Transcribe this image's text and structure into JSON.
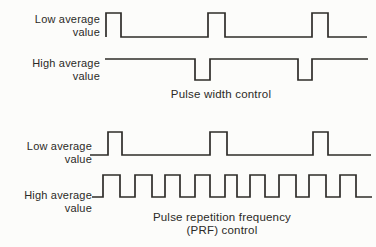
{
  "figure": {
    "background": "#fcfcfa",
    "line_color": "#2e2c29",
    "text_color": "#2b2a27",
    "sections": [
      {
        "name": "pulse-width-control",
        "caption": "Pulse width control",
        "rows": [
          {
            "label": "Low average\nvalue"
          },
          {
            "label": "High average\nvalue"
          }
        ]
      },
      {
        "name": "prf-control",
        "caption": "Pulse repetition frequency\n(PRF) control",
        "rows": [
          {
            "label": "Low average\nvalue"
          },
          {
            "label": "High average\nvalue"
          }
        ]
      }
    ],
    "waveforms": [
      {
        "name": "waveform-low-average-pulse-width",
        "points": [
          [
            106,
            37
          ],
          [
            106,
            13
          ],
          [
            121,
            13
          ],
          [
            121,
            37
          ],
          [
            208,
            37
          ],
          [
            208,
            13
          ],
          [
            225,
            13
          ],
          [
            225,
            37
          ],
          [
            312,
            37
          ],
          [
            312,
            13
          ],
          [
            328,
            13
          ],
          [
            328,
            37
          ],
          [
            367,
            37
          ]
        ]
      },
      {
        "name": "waveform-high-average-pulse-width",
        "points": [
          [
            105,
            59
          ],
          [
            195,
            59
          ],
          [
            195,
            80
          ],
          [
            210,
            80
          ],
          [
            210,
            59
          ],
          [
            298,
            59
          ],
          [
            298,
            80
          ],
          [
            312,
            80
          ],
          [
            312,
            59
          ],
          [
            368,
            59
          ]
        ]
      },
      {
        "name": "waveform-low-average-prf",
        "points": [
          [
            90,
            155
          ],
          [
            108,
            155
          ],
          [
            108,
            132
          ],
          [
            122,
            132
          ],
          [
            122,
            155
          ],
          [
            210,
            155
          ],
          [
            210,
            132
          ],
          [
            227,
            132
          ],
          [
            227,
            155
          ],
          [
            313,
            155
          ],
          [
            313,
            132
          ],
          [
            328,
            132
          ],
          [
            328,
            155
          ],
          [
            371,
            155
          ]
        ]
      },
      {
        "name": "waveform-high-average-prf",
        "points": [
          [
            92,
            197
          ],
          [
            103,
            197
          ],
          [
            103,
            175
          ],
          [
            120,
            175
          ],
          [
            120,
            197
          ],
          [
            135,
            197
          ],
          [
            135,
            175
          ],
          [
            152,
            175
          ],
          [
            152,
            197
          ],
          [
            165,
            197
          ],
          [
            165,
            175
          ],
          [
            180,
            175
          ],
          [
            180,
            197
          ],
          [
            195,
            197
          ],
          [
            195,
            175
          ],
          [
            210,
            175
          ],
          [
            210,
            197
          ],
          [
            225,
            197
          ],
          [
            225,
            175
          ],
          [
            237,
            175
          ],
          [
            237,
            197
          ],
          [
            250,
            197
          ],
          [
            250,
            175
          ],
          [
            265,
            175
          ],
          [
            265,
            197
          ],
          [
            279,
            197
          ],
          [
            279,
            175
          ],
          [
            296,
            175
          ],
          [
            296,
            197
          ],
          [
            309,
            197
          ],
          [
            309,
            175
          ],
          [
            326,
            175
          ],
          [
            326,
            197
          ],
          [
            340,
            197
          ],
          [
            340,
            175
          ],
          [
            356,
            175
          ],
          [
            356,
            197
          ],
          [
            372,
            197
          ]
        ]
      }
    ]
  }
}
